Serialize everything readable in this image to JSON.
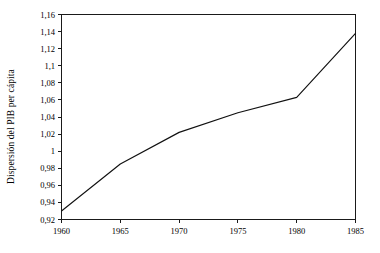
{
  "chart_data": {
    "type": "line",
    "title": "",
    "subtitle": "",
    "xlabel": "",
    "ylabel": "Dispersión del PIB per cápita",
    "x": [
      1960,
      1965,
      1970,
      1975,
      1980,
      1985
    ],
    "series": [
      {
        "name": "Dispersión del PIB per cápita",
        "values": [
          0.93,
          0.985,
          1.022,
          1.045,
          1.063,
          1.138
        ]
      }
    ],
    "xlim": [
      1960,
      1985
    ],
    "ylim": [
      0.92,
      1.16
    ],
    "xticks": [
      1960,
      1965,
      1970,
      1975,
      1980,
      1985
    ],
    "xticklabels": [
      "1960",
      "1965",
      "1970",
      "1975",
      "1980",
      "1985"
    ],
    "yticks": [
      0.92,
      0.94,
      0.96,
      0.98,
      1.0,
      1.02,
      1.04,
      1.06,
      1.08,
      1.1,
      1.12,
      1.14,
      1.16
    ],
    "yticklabels": [
      "0,92",
      "0,94",
      "0,96",
      "0,98",
      "1",
      "1,02",
      "1,04",
      "1,06",
      "1,08",
      "1,1",
      "1,12",
      "1,14",
      "1,16"
    ],
    "grid": false,
    "legend": false,
    "legend_position": "none",
    "line_color": "#111111",
    "background_color": "#ffffff",
    "axis_color": "#1a1a1a",
    "annotations": []
  }
}
